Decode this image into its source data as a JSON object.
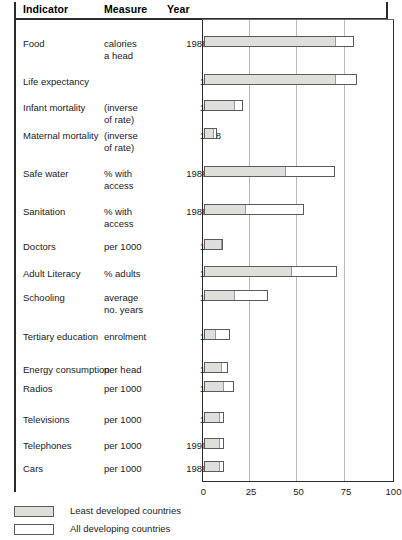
{
  "columns": {
    "indicator": "Indicator",
    "measure": "Measure",
    "year": "Year"
  },
  "legend": {
    "least": "Least developed countries",
    "all": "All developing countries"
  },
  "axis": {
    "ticks": [
      "0",
      "25",
      "50",
      "75",
      "100"
    ]
  },
  "colors": {
    "least_developed": "#dededa",
    "all_developing": "#ffffff",
    "bar_outline": "#5a5a5a",
    "gridline": "#b9b9b9",
    "frame": "#2b2b2b"
  },
  "rows": [
    {
      "indicator": "Food",
      "measure": "calories\na head",
      "year": "1988-90"
    },
    {
      "indicator": "Life expectancy",
      "measure": "",
      "year": "1992"
    },
    {
      "indicator": "Infant mortality",
      "measure": "(inverse\nof rate)",
      "year": "1992"
    },
    {
      "indicator": "Maternal mortality",
      "measure": "(inverse\nof rate)",
      "year": "1988"
    },
    {
      "indicator": "Safe water",
      "measure": "% with\naccess",
      "year": "1988-91"
    },
    {
      "indicator": "Sanitation",
      "measure": "% with\naccess",
      "year": "1988-90"
    },
    {
      "indicator": "Doctors",
      "measure": "per 1000",
      "year": "1990"
    },
    {
      "indicator": "Adult Literacy",
      "measure": "% adults",
      "year": "1992"
    },
    {
      "indicator": "Schooling",
      "measure": "average\nno. years",
      "year": "1992"
    },
    {
      "indicator": "Tertiary education",
      "measure": "enrolment",
      "year": "1990"
    },
    {
      "indicator": "Energy consumption",
      "measure": "per head",
      "year": "1991"
    },
    {
      "indicator": "Radios",
      "measure": "per 1000",
      "year": "1990"
    },
    {
      "indicator": "Televisions",
      "measure": "per 1000",
      "year": "1990"
    },
    {
      "indicator": "Telephones",
      "measure": "per 1000",
      "year": "1990-92"
    },
    {
      "indicator": "Cars",
      "measure": "per 1000",
      "year": "1989-90"
    }
  ],
  "chart_data": {
    "type": "bar",
    "orientation": "horizontal",
    "title": "",
    "xlabel": "",
    "ylabel": "",
    "xlim": [
      0,
      100
    ],
    "xticks": [
      0,
      25,
      50,
      75,
      100
    ],
    "grid": true,
    "legend_position": "bottom-left",
    "categories": [
      "Food",
      "Life expectancy",
      "Infant mortality",
      "Maternal mortality",
      "Safe water",
      "Sanitation",
      "Doctors",
      "Adult Literacy",
      "Schooling",
      "Tertiary education",
      "Energy consumption",
      "Radios",
      "Televisions",
      "Telephones",
      "Cars"
    ],
    "series": [
      {
        "name": "Least developed countries",
        "color": "#dededa",
        "values": [
          69,
          69,
          16,
          5,
          43,
          22,
          9,
          46,
          16,
          6,
          9,
          10,
          8,
          8,
          8
        ]
      },
      {
        "name": "All developing countries",
        "color": "#ffffff",
        "values": [
          79,
          81,
          21,
          7,
          69,
          53,
          10,
          70,
          34,
          14,
          13,
          16,
          11,
          11,
          11
        ]
      }
    ]
  }
}
